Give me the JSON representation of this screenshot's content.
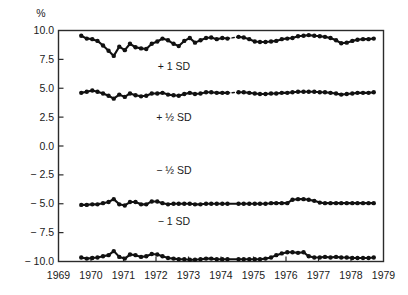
{
  "chart_data": {
    "type": "line",
    "title": "",
    "xlabel": "",
    "ylabel": "%",
    "yunit_label": "%",
    "xlim": [
      1969,
      1979
    ],
    "ylim": [
      -10.0,
      10.0
    ],
    "grid": false,
    "legend": "inline-annotations",
    "xticks": [
      1969,
      1970,
      1971,
      1972,
      1973,
      1974,
      1975,
      1976,
      1977,
      1978,
      1979
    ],
    "xtick_labels": [
      "1969",
      "1970",
      "1971",
      "1972",
      "1973",
      "1974",
      "1975",
      "1976",
      "1977",
      "1978",
      "1979"
    ],
    "yticks": [
      10.0,
      7.5,
      5.0,
      2.5,
      0.0,
      -2.5,
      -5.0,
      -7.5,
      -10.0
    ],
    "ytick_labels": [
      "10.0",
      "7.5",
      "5.0",
      "2.5",
      "0.0",
      "− 2.5",
      "− 5.0",
      "− 7.5",
      "− 10.0"
    ],
    "annotations": [
      {
        "text": "+ 1 SD",
        "x": 1972.55,
        "y": 6.55
      },
      {
        "text": "+ ½ SD",
        "x": 1972.55,
        "y": 2.15
      },
      {
        "text": "− ½ SD",
        "x": 1972.55,
        "y": -2.45
      },
      {
        "text": "− 1 SD",
        "x": 1972.55,
        "y": -6.85
      }
    ],
    "marker": "filled-circle",
    "gap_style": "dotted",
    "series": [
      {
        "name": "+ 1 SD",
        "x": [
          1969.7,
          1969.87,
          1970.04,
          1970.2,
          1970.37,
          1970.54,
          1970.7,
          1970.87,
          1971.04,
          1971.2,
          1971.37,
          1971.54,
          1971.7,
          1971.87,
          1972.04,
          1972.2,
          1972.37,
          1972.54,
          1972.7,
          1972.87,
          1973.04,
          1973.2,
          1973.37,
          1973.54,
          1973.7,
          1973.87,
          1974.04,
          1974.2,
          1974.54,
          1974.7,
          1974.87,
          1975.04,
          1975.2,
          1975.37,
          1975.54,
          1975.7,
          1975.87,
          1976.04,
          1976.2,
          1976.37,
          1976.54,
          1976.7,
          1976.87,
          1977.04,
          1977.2,
          1977.37,
          1977.54,
          1977.7,
          1977.87,
          1978.04,
          1978.2,
          1978.37,
          1978.54,
          1978.7
        ],
        "y": [
          9.55,
          9.3,
          9.25,
          9.1,
          8.7,
          8.25,
          7.8,
          8.6,
          8.3,
          8.85,
          8.55,
          8.45,
          8.4,
          8.85,
          9.05,
          9.3,
          9.15,
          8.85,
          8.65,
          9.1,
          9.35,
          8.95,
          9.15,
          9.35,
          9.4,
          9.25,
          9.35,
          9.3,
          9.45,
          9.4,
          9.25,
          9.05,
          9.0,
          9.0,
          9.05,
          9.1,
          9.25,
          9.3,
          9.35,
          9.5,
          9.55,
          9.6,
          9.55,
          9.5,
          9.45,
          9.35,
          9.15,
          8.9,
          8.95,
          9.1,
          9.2,
          9.25,
          9.25,
          9.3
        ],
        "gaps": [
          [
            1974.2,
            1974.54
          ]
        ]
      },
      {
        "name": "+ ½ SD",
        "x": [
          1969.7,
          1969.87,
          1970.04,
          1970.2,
          1970.37,
          1970.54,
          1970.7,
          1970.87,
          1971.04,
          1971.2,
          1971.37,
          1971.54,
          1971.7,
          1971.87,
          1972.04,
          1972.2,
          1972.37,
          1972.54,
          1972.7,
          1972.87,
          1973.04,
          1973.2,
          1973.37,
          1973.54,
          1973.7,
          1973.87,
          1974.04,
          1974.2,
          1974.54,
          1974.7,
          1974.87,
          1975.04,
          1975.2,
          1975.37,
          1975.54,
          1975.7,
          1975.87,
          1976.04,
          1976.2,
          1976.37,
          1976.54,
          1976.7,
          1976.87,
          1977.04,
          1977.2,
          1977.37,
          1977.54,
          1977.7,
          1977.87,
          1978.04,
          1978.2,
          1978.37,
          1978.54,
          1978.7
        ],
        "y": [
          4.6,
          4.7,
          4.8,
          4.7,
          4.55,
          4.35,
          4.1,
          4.45,
          4.25,
          4.55,
          4.4,
          4.3,
          4.35,
          4.55,
          4.55,
          4.6,
          4.45,
          4.4,
          4.35,
          4.5,
          4.6,
          4.5,
          4.55,
          4.65,
          4.65,
          4.6,
          4.6,
          4.6,
          4.65,
          4.65,
          4.6,
          4.55,
          4.5,
          4.5,
          4.55,
          4.55,
          4.6,
          4.6,
          4.65,
          4.7,
          4.7,
          4.7,
          4.7,
          4.65,
          4.65,
          4.6,
          4.55,
          4.45,
          4.5,
          4.55,
          4.6,
          4.6,
          4.6,
          4.65
        ],
        "gaps": [
          [
            1974.2,
            1974.54
          ]
        ]
      },
      {
        "name": "− ½ SD",
        "x": [
          1969.7,
          1969.87,
          1970.04,
          1970.2,
          1970.37,
          1970.54,
          1970.7,
          1970.87,
          1971.04,
          1971.2,
          1971.37,
          1971.54,
          1971.7,
          1971.87,
          1972.04,
          1972.2,
          1972.37,
          1972.54,
          1972.7,
          1972.87,
          1973.04,
          1973.2,
          1973.37,
          1973.54,
          1973.7,
          1973.87,
          1974.04,
          1974.2,
          1974.54,
          1974.7,
          1974.87,
          1975.04,
          1975.2,
          1975.37,
          1975.54,
          1975.7,
          1975.87,
          1976.04,
          1976.2,
          1976.37,
          1976.54,
          1976.7,
          1976.87,
          1977.04,
          1977.2,
          1977.37,
          1977.54,
          1977.7,
          1977.87,
          1978.04,
          1978.2,
          1978.37,
          1978.54,
          1978.7
        ],
        "y": [
          -5.1,
          -5.1,
          -5.05,
          -5.05,
          -4.95,
          -4.85,
          -4.6,
          -5.05,
          -5.15,
          -4.85,
          -4.85,
          -5.05,
          -5.05,
          -4.8,
          -4.8,
          -4.95,
          -5.05,
          -5.0,
          -5.0,
          -5.0,
          -5.0,
          -5.05,
          -5.05,
          -5.0,
          -5.0,
          -5.0,
          -5.0,
          -5.0,
          -5.0,
          -5.0,
          -5.0,
          -5.0,
          -5.0,
          -5.0,
          -4.95,
          -4.95,
          -4.95,
          -4.95,
          -4.65,
          -4.6,
          -4.6,
          -4.65,
          -4.75,
          -4.9,
          -4.95,
          -4.95,
          -4.95,
          -4.95,
          -4.95,
          -4.95,
          -4.95,
          -4.95,
          -4.95,
          -4.95
        ],
        "gaps": [
          [
            1970.2,
            1970.54
          ]
        ]
      },
      {
        "name": "− 1 SD",
        "x": [
          1969.7,
          1969.87,
          1970.04,
          1970.2,
          1970.37,
          1970.54,
          1970.7,
          1970.87,
          1971.04,
          1971.2,
          1971.37,
          1971.54,
          1971.7,
          1971.87,
          1972.04,
          1972.2,
          1972.37,
          1972.54,
          1972.7,
          1972.87,
          1973.04,
          1973.2,
          1973.37,
          1973.54,
          1973.7,
          1973.87,
          1974.04,
          1974.2,
          1974.54,
          1974.7,
          1974.87,
          1975.04,
          1975.2,
          1975.37,
          1975.54,
          1975.7,
          1975.87,
          1976.04,
          1976.2,
          1976.37,
          1976.54,
          1976.7,
          1976.87,
          1977.04,
          1977.2,
          1977.37,
          1977.54,
          1977.7,
          1977.87,
          1978.04,
          1978.2,
          1978.37,
          1978.54,
          1978.7
        ],
        "y": [
          -9.65,
          -9.75,
          -9.7,
          -9.65,
          -9.55,
          -9.45,
          -9.1,
          -9.6,
          -9.75,
          -9.4,
          -9.45,
          -9.6,
          -9.55,
          -9.35,
          -9.4,
          -9.55,
          -9.7,
          -9.75,
          -9.8,
          -9.8,
          -9.85,
          -9.85,
          -9.8,
          -9.75,
          -9.75,
          -9.8,
          -9.8,
          -9.8,
          -9.8,
          -9.8,
          -9.8,
          -9.8,
          -9.8,
          -9.75,
          -9.65,
          -9.45,
          -9.3,
          -9.2,
          -9.2,
          -9.25,
          -9.2,
          -9.55,
          -9.65,
          -9.65,
          -9.6,
          -9.65,
          -9.6,
          -9.65,
          -9.65,
          -9.7,
          -9.7,
          -9.7,
          -9.7,
          -9.65
        ],
        "gaps": [
          [
            1970.2,
            1970.54
          ]
        ]
      }
    ]
  }
}
